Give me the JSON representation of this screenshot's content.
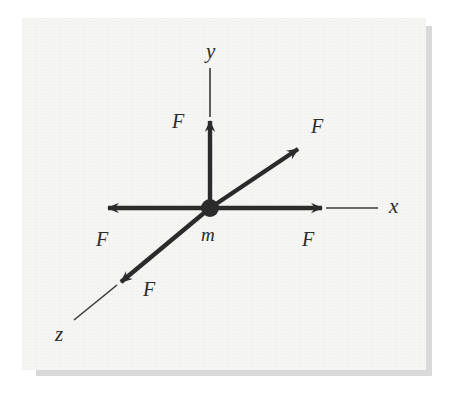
{
  "figure": {
    "background_color": "#ffffff",
    "paper_color": "#f6f6f4",
    "ink_color": "#2b2b2b",
    "shadow_color": "#d9d9d9"
  },
  "axes": [
    {
      "name": "x",
      "label": "x",
      "label_x": 389,
      "label_y": 213,
      "direction": "right"
    },
    {
      "name": "y",
      "label": "y",
      "label_x": 206,
      "label_y": 58,
      "direction": "up"
    },
    {
      "name": "z",
      "label": "z",
      "label_x": 55,
      "label_y": 341,
      "direction": "down-left"
    }
  ],
  "mass": {
    "label": "m",
    "label_x": 201,
    "label_y": 241,
    "origin_x": 210,
    "origin_y": 208,
    "dot_radius": 9
  },
  "forces": [
    {
      "id": "force-positive-x",
      "label": "F",
      "label_x": 302,
      "label_y": 246,
      "from_x": 210,
      "from_y": 208,
      "to_x": 326,
      "to_y": 208,
      "direction": "positive-x"
    },
    {
      "id": "force-negative-x",
      "label": "F",
      "label_x": 96,
      "label_y": 246,
      "from_x": 210,
      "from_y": 208,
      "to_x": 104,
      "to_y": 208,
      "direction": "negative-x"
    },
    {
      "id": "force-positive-y",
      "label": "F",
      "label_x": 172,
      "label_y": 128,
      "from_x": 210,
      "from_y": 208,
      "to_x": 210,
      "to_y": 117,
      "direction": "positive-y"
    },
    {
      "id": "force-diagonal-upper-right",
      "label": "F",
      "label_x": 311,
      "label_y": 133,
      "from_x": 210,
      "from_y": 208,
      "to_x": 302,
      "to_y": 146,
      "direction": "up-right-diagonal"
    },
    {
      "id": "force-positive-z",
      "label": "F",
      "label_x": 143,
      "label_y": 296,
      "from_x": 210,
      "from_y": 208,
      "to_x": 117,
      "to_y": 285,
      "direction": "down-left-along-z"
    }
  ],
  "axis_lines": [
    {
      "id": "x-axis-extension",
      "from_x": 326,
      "from_y": 208,
      "to_x": 378,
      "to_y": 208
    },
    {
      "id": "y-axis-extension",
      "from_x": 210,
      "from_y": 117,
      "to_x": 210,
      "to_y": 68
    },
    {
      "id": "z-axis-extension",
      "from_x": 117,
      "from_y": 285,
      "to_x": 74,
      "to_y": 320
    }
  ]
}
